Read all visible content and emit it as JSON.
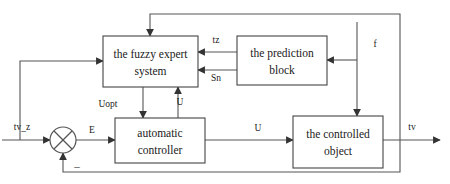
{
  "diagram": {
    "type": "block-diagram",
    "blocks": [
      {
        "id": "fuzzy-expert-system",
        "line1": "the fuzzy expert",
        "line2": "system",
        "x": 103,
        "y": 36,
        "w": 95,
        "h": 51
      },
      {
        "id": "prediction-block",
        "line1": "the prediction",
        "line2": "block",
        "x": 237,
        "y": 36,
        "w": 90,
        "h": 49
      },
      {
        "id": "automatic-controller",
        "line1": "automatic",
        "line2": "controller",
        "x": 115,
        "y": 118,
        "w": 90,
        "h": 45
      },
      {
        "id": "controlled-object",
        "line1": "the controlled",
        "line2": "object",
        "x": 293,
        "y": 116,
        "w": 90,
        "h": 52
      }
    ],
    "junction": {
      "id": "summing-junction",
      "cx": 63,
      "cy": 140,
      "r": 13,
      "style": "circle-with-x-cross"
    },
    "signals": [
      {
        "id": "input-setpoint",
        "label": "tv_z",
        "x": 22,
        "y": 130
      },
      {
        "id": "error",
        "label": "E",
        "x": 90,
        "y": 133
      },
      {
        "id": "control-output",
        "label": "U",
        "x": 262,
        "y": 130
      },
      {
        "id": "optimal-control",
        "label": "Uopt",
        "x": 108,
        "y": 107
      },
      {
        "id": "control-feedback-up",
        "label": "U",
        "x": 180,
        "y": 104
      },
      {
        "id": "prediction-tz",
        "label": "tz",
        "x": 215,
        "y": 41
      },
      {
        "id": "prediction-sn",
        "label": "Sn",
        "x": 215,
        "y": 80
      },
      {
        "id": "disturbance",
        "label": "f",
        "x": 372,
        "y": 45
      },
      {
        "id": "output-temperature",
        "label": "tv",
        "x": 408,
        "y": 127
      },
      {
        "id": "negative-feedback-sign",
        "label": "–",
        "x": 75,
        "y": 167
      }
    ],
    "colors": {
      "stroke": "#555555",
      "block_stroke": "#444444",
      "text": "#1a1a1a",
      "background": "#ffffff"
    }
  }
}
